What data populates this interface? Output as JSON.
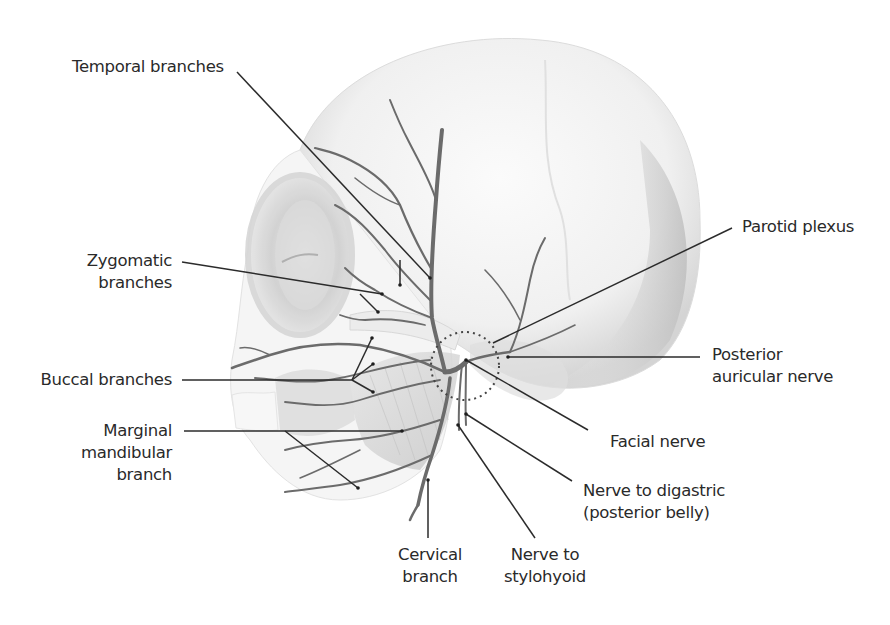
{
  "diagram": {
    "colors": {
      "nerve": "#6b6b6b",
      "leader_line": "#2b2b2b",
      "skull_shade": "#d9d9d9",
      "text": "#2a2a2a",
      "background": "#ffffff"
    },
    "labels": {
      "temporal": {
        "lines": [
          "Temporal branches"
        ]
      },
      "zygomatic": {
        "lines": [
          "Zygomatic",
          "branches"
        ]
      },
      "buccal": {
        "lines": [
          "Buccal branches"
        ]
      },
      "marginal": {
        "lines": [
          "Marginal",
          "mandibular",
          "branch"
        ]
      },
      "cervical": {
        "lines": [
          "Cervical",
          "branch"
        ]
      },
      "stylohyoid": {
        "lines": [
          "Nerve to",
          "stylohyoid"
        ]
      },
      "digastric": {
        "lines": [
          "Nerve to digastric",
          "(posterior belly)"
        ]
      },
      "facial": {
        "lines": [
          "Facial nerve"
        ]
      },
      "posterior_auricular": {
        "lines": [
          "Posterior",
          "auricular nerve"
        ]
      },
      "parotid": {
        "lines": [
          "Parotid plexus"
        ]
      }
    }
  }
}
